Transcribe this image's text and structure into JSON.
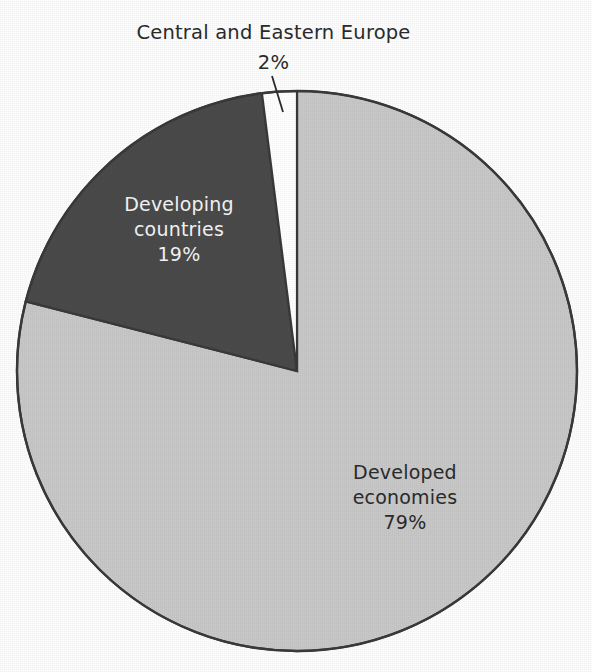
{
  "chart_data": {
    "type": "pie",
    "title": "",
    "categories": [
      "Developed economies",
      "Developing countries",
      "Central and Eastern Europe"
    ],
    "values": [
      79,
      19,
      2
    ],
    "value_labels": [
      "79%",
      "19%",
      "2%"
    ],
    "units": "percent",
    "total": 100,
    "start_angle_deg": 0,
    "direction": "clockwise",
    "legend": "none",
    "grid": false,
    "slice_colors": [
      "#c8c8c8",
      "#4a4a4a",
      "#ffffff"
    ],
    "slices": [
      {
        "name": "Developed economies",
        "value": 79,
        "label": "Developed economies",
        "value_label": "79%",
        "color": "#c8c8c8",
        "label_placement": "inside",
        "label_text_color": "#2b2b2b"
      },
      {
        "name": "Developing countries",
        "value": 19,
        "label": "Developing countries",
        "value_label": "19%",
        "color": "#4a4a4a",
        "label_placement": "inside",
        "label_text_color": "#f4f4f4"
      },
      {
        "name": "Central and Eastern Europe",
        "value": 2,
        "label": "Central and Eastern Europe",
        "value_label": "2%",
        "color": "#ffffff",
        "label_placement": "outside-callout",
        "label_text_color": "#2b2b2b"
      }
    ]
  },
  "figure": {
    "background_color": "#fdfdfd",
    "outline_color": "#3a3a3a",
    "leader_line_color": "#2b2b2b"
  },
  "labels": {
    "developed": {
      "line1": "Developed",
      "line2": "economies",
      "line3": "79%"
    },
    "developing": {
      "line1": "Developing",
      "line2": "countries",
      "line3": "19%"
    },
    "cee": {
      "line1": "Central and Eastern Europe",
      "line2": "2%"
    }
  }
}
